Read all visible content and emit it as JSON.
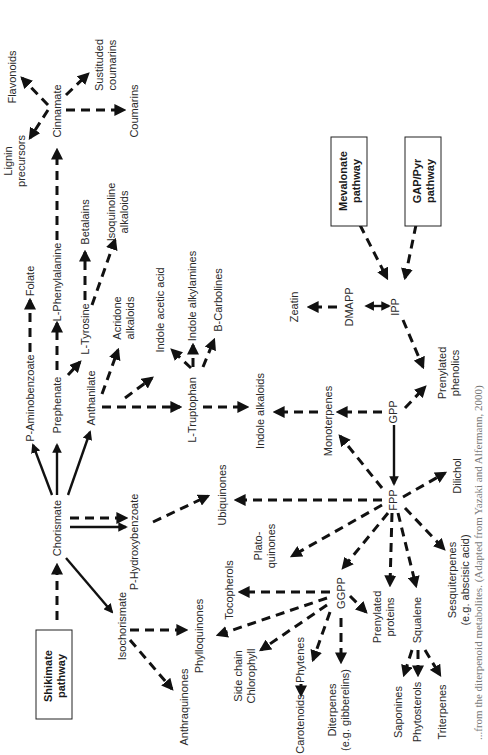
{
  "diagram": {
    "orientation": "rotated 90 degrees counter-clockwise",
    "caption": "...from the diterpenoid metabolites. (Adapted from Yazaki and Alfermann, 2000)",
    "boxes": {
      "shikimate": [
        "Shikimate",
        "pathway"
      ],
      "mevalonate": [
        "Mevalonate",
        "pathway"
      ],
      "gap_pyr": [
        "GAP/Pyr",
        "pathway"
      ]
    },
    "nodes": {
      "chorismate": "Chorismate",
      "isochorismate": "Isochorismate",
      "p_aminobenzoate": "P-Aminobenzoate",
      "folate": "Folate",
      "prephenate": "Prephenate",
      "l_phenylalanine": "L-Phenylalanine",
      "cinnamate": "Cinnamate",
      "lignin": [
        "Lignin",
        "precursors"
      ],
      "flavonoids": "Flavonoids",
      "substituted_coumarins": [
        "Sustituded",
        "coumarins"
      ],
      "coumarins": "Coumarins",
      "l_tyrosine": "L-Tyrosine",
      "betalains": "Betalains",
      "isoquinoline": [
        "Isoquinoline",
        "alkaloids"
      ],
      "anthanilate": "Anthanilate",
      "acridone": [
        "Acridone",
        "alkaloids"
      ],
      "indole_acetic_acid": "Indole acetic acid",
      "l_truptophan": "L-Truptophan",
      "indole_alkylamines": "Indole alkylamines",
      "b_carbolines": "B-Carbolines",
      "indole_alkaloids": "Indole alkaloids",
      "p_hydroxybenzoate": "P-Hydroxybenzoate",
      "ubiquinones": "Ubiquinones",
      "phylloquinones": "Phylloquinones",
      "anthraquinones": "Anthraquinones",
      "tocopherols": "Tocopherols",
      "platoquinones": [
        "Plato-",
        "quinones"
      ],
      "side_chain_chlorophyll": [
        "Side chain",
        "Chlorophyll"
      ],
      "phytenes": "Phytenes",
      "carotenoids": "Carotenoids",
      "diterpenes": [
        "Diterpenes",
        "(e.g. gibberelins)"
      ],
      "ggpp": "GGPP",
      "prenylated_proteins": [
        "Prenylated",
        "proteins"
      ],
      "squalene": "Squalene",
      "saponines": "Saponines",
      "phytosterols": "Phytosterols",
      "triterpenes": "Triterpenes",
      "fpp": "FPP",
      "sesquiterpenes": [
        "Sesquiterpenes",
        "(e.g. abscisic acid)"
      ],
      "dilichol": "Dilichol",
      "gpp": "GPP",
      "monoterpenes": "Monoterpenes",
      "prenylated_phenolics": [
        "Prenylated",
        "phenolics"
      ],
      "ipp": "IPP",
      "dmapp": "DMAPP",
      "zeatin": "Zeatin"
    },
    "edges": [
      {
        "from": "Shikimate pathway",
        "to": "Chorismate",
        "style": "dashed"
      },
      {
        "from": "Chorismate",
        "to": "P-Aminobenzoate",
        "style": "solid"
      },
      {
        "from": "Chorismate",
        "to": "Prephenate",
        "style": "solid"
      },
      {
        "from": "Chorismate",
        "to": "Anthanilate",
        "style": "solid"
      },
      {
        "from": "Chorismate",
        "to": "P-Hydroxybenzoate",
        "style": "dashed+solid"
      },
      {
        "from": "Chorismate",
        "to": "Isochorismate",
        "style": "solid"
      },
      {
        "from": "P-Aminobenzoate",
        "to": "Folate",
        "style": "dashed"
      },
      {
        "from": "Prephenate",
        "to": "L-Phenylalanine",
        "style": "dashed"
      },
      {
        "from": "Prephenate",
        "to": "L-Tyrosine",
        "style": "dashed"
      },
      {
        "from": "L-Phenylalanine",
        "to": "Cinnamate",
        "style": "dashed"
      },
      {
        "from": "Cinnamate",
        "to": "Lignin precursors",
        "style": "dashed"
      },
      {
        "from": "Cinnamate",
        "to": "Flavonoids",
        "style": "dashed"
      },
      {
        "from": "Cinnamate",
        "to": "Sustituded coumarins",
        "style": "dashed"
      },
      {
        "from": "Cinnamate",
        "to": "Coumarins",
        "style": "dashed"
      },
      {
        "from": "L-Tyrosine",
        "to": "Betalains",
        "style": "dashed"
      },
      {
        "from": "L-Tyrosine",
        "to": "Isoquinoline alkaloids",
        "style": "dashed"
      },
      {
        "from": "Anthanilate",
        "to": "Acridone alkaloids",
        "style": "dashed"
      },
      {
        "from": "Anthanilate",
        "to": "Indole acetic acid",
        "style": "dashed"
      },
      {
        "from": "Anthanilate",
        "to": "L-Truptophan",
        "style": "dashed"
      },
      {
        "from": "L-Truptophan",
        "to": "Indole acetic acid",
        "style": "dashed"
      },
      {
        "from": "L-Truptophan",
        "to": "Indole alkylamines",
        "style": "dashed"
      },
      {
        "from": "L-Truptophan",
        "to": "B-Carbolines",
        "style": "dashed"
      },
      {
        "from": "L-Truptophan",
        "to": "Indole alkaloids",
        "style": "dashed"
      },
      {
        "from": "P-Hydroxybenzoate",
        "to": "Ubiquinones",
        "style": "dashed"
      },
      {
        "from": "Isochorismate",
        "to": "Phylloquinones",
        "style": "dashed"
      },
      {
        "from": "Isochorismate",
        "to": "Anthraquinones",
        "style": "dashed"
      },
      {
        "from": "Mevalonate pathway",
        "to": "IPP",
        "style": "dashed"
      },
      {
        "from": "GAP/Pyr pathway",
        "to": "IPP",
        "style": "dashed"
      },
      {
        "from": "IPP",
        "to": "DMAPP",
        "style": "solid-bidirectional"
      },
      {
        "from": "DMAPP",
        "to": "Zeatin",
        "style": "dashed"
      },
      {
        "from": "IPP",
        "to": "Prenylated phenolics",
        "style": "dashed"
      },
      {
        "from": "GPP",
        "to": "Prenylated phenolics",
        "style": "dashed"
      },
      {
        "from": "GPP",
        "to": "Monoterpenes",
        "style": "dashed"
      },
      {
        "from": "Monoterpenes",
        "to": "Indole alkaloids",
        "style": "dashed"
      },
      {
        "from": "GPP",
        "to": "FPP",
        "style": "solid"
      },
      {
        "from": "FPP",
        "to": "Monoterpenes",
        "style": "dashed"
      },
      {
        "from": "FPP",
        "to": "Ubiquinones",
        "style": "dashed"
      },
      {
        "from": "FPP",
        "to": "Plato-quinones",
        "style": "dashed"
      },
      {
        "from": "FPP",
        "to": "GGPP",
        "style": "dashed"
      },
      {
        "from": "FPP",
        "to": "Prenylated proteins",
        "style": "dashed"
      },
      {
        "from": "FPP",
        "to": "Squalene",
        "style": "dashed"
      },
      {
        "from": "FPP",
        "to": "Sesquiterpenes",
        "style": "dashed"
      },
      {
        "from": "FPP",
        "to": "Dilichol",
        "style": "dashed"
      },
      {
        "from": "GGPP",
        "to": "Tocopherols",
        "style": "dashed"
      },
      {
        "from": "GGPP",
        "to": "Phylloquinones",
        "style": "dashed"
      },
      {
        "from": "GGPP",
        "to": "Side chain Chlorophyll",
        "style": "dashed"
      },
      {
        "from": "GGPP",
        "to": "Phytenes",
        "style": "dashed"
      },
      {
        "from": "GGPP",
        "to": "Diterpenes",
        "style": "dashed"
      },
      {
        "from": "GGPP",
        "to": "Prenylated proteins",
        "style": "dashed"
      },
      {
        "from": "Phytenes",
        "to": "Carotenoids",
        "style": "dashed"
      },
      {
        "from": "Squalene",
        "to": "Saponines",
        "style": "dashed"
      },
      {
        "from": "Squalene",
        "to": "Phytosterols",
        "style": "dashed"
      },
      {
        "from": "Squalene",
        "to": "Triterpenes",
        "style": "dashed"
      }
    ]
  }
}
